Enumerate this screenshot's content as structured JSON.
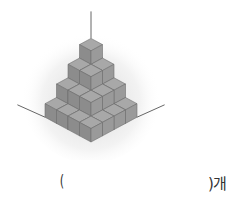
{
  "figure": {
    "layers": [
      {
        "level": 1,
        "size": 1
      },
      {
        "level": 2,
        "size": 2
      },
      {
        "level": 3,
        "size": 3
      },
      {
        "level": 4,
        "size": 4
      }
    ],
    "colors": {
      "top": "#a8a8a8",
      "left": "#8c8c8c",
      "right": "#9a9a9a",
      "edge": "#6e6e6e",
      "axis": "#666666",
      "glow": "#d9d9d9"
    }
  },
  "answer": {
    "open_paren": "(",
    "close_paren_unit": ")개",
    "value": ""
  }
}
